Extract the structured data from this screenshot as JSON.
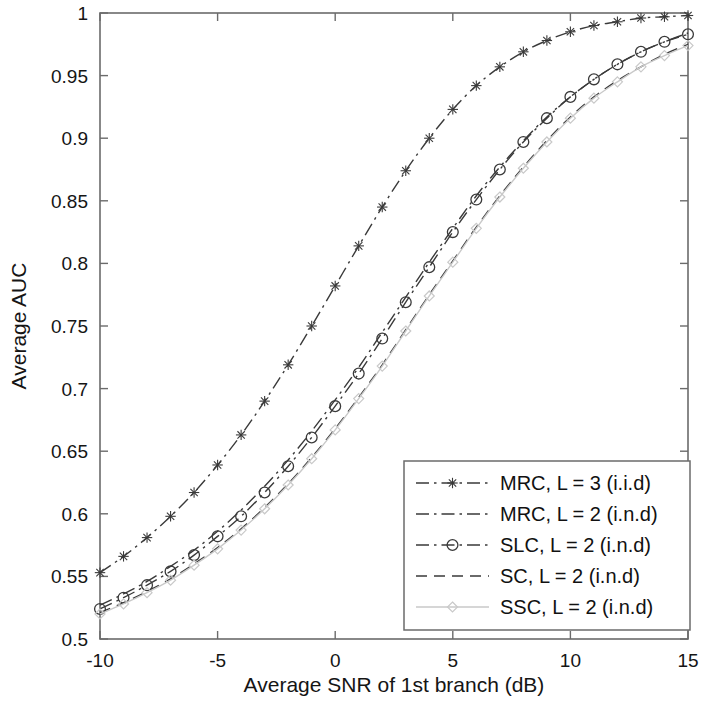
{
  "chart_data": {
    "type": "line",
    "title": "",
    "xlabel": "Average SNR of 1st branch (dB)",
    "ylabel": "Average AUC",
    "xlim": [
      -10,
      15
    ],
    "ylim": [
      0.5,
      1
    ],
    "xticks": [
      -10,
      -5,
      0,
      5,
      10,
      15
    ],
    "xtick_labels": [
      "-10",
      "-5",
      "0",
      "5",
      "10",
      "15"
    ],
    "yticks": [
      0.5,
      0.55,
      0.6,
      0.65,
      0.7,
      0.75,
      0.8,
      0.85,
      0.9,
      0.95,
      1
    ],
    "ytick_labels": [
      "0.5",
      "0.55",
      "0.6",
      "0.65",
      "0.7",
      "0.75",
      "0.8",
      "0.85",
      "0.9",
      "0.95",
      "1"
    ],
    "grid": false,
    "legend_position": "lower right",
    "x": [
      -10,
      -9,
      -8,
      -7,
      -6,
      -5,
      -4,
      -3,
      -2,
      -1,
      0,
      1,
      2,
      3,
      4,
      5,
      6,
      7,
      8,
      9,
      10,
      11,
      12,
      13,
      14,
      15
    ],
    "series": [
      {
        "name": "MRC, L = 3 (i.i.d)",
        "marker": "star",
        "linestyle": "dash-dot",
        "color": "#3a3a3a",
        "values": [
          0.553,
          0.566,
          0.581,
          0.598,
          0.617,
          0.639,
          0.663,
          0.69,
          0.719,
          0.75,
          0.782,
          0.814,
          0.845,
          0.874,
          0.9,
          0.923,
          0.942,
          0.957,
          0.969,
          0.978,
          0.985,
          0.99,
          0.993,
          0.996,
          0.997,
          0.998
        ]
      },
      {
        "name": "MRC, L = 2 (i.n.d)",
        "marker": "none",
        "linestyle": "dash-dot",
        "color": "#3a3a3a",
        "values": [
          0.527,
          0.536,
          0.546,
          0.558,
          0.571,
          0.586,
          0.603,
          0.622,
          0.643,
          0.666,
          0.691,
          0.717,
          0.745,
          0.773,
          0.801,
          0.828,
          0.854,
          0.877,
          0.898,
          0.917,
          0.933,
          0.947,
          0.959,
          0.969,
          0.977,
          0.984
        ]
      },
      {
        "name": "SLC, L = 2 (i.n.d)",
        "marker": "circle",
        "linestyle": "dash-dot",
        "color": "#3a3a3a",
        "values": [
          0.524,
          0.533,
          0.543,
          0.554,
          0.567,
          0.582,
          0.598,
          0.617,
          0.638,
          0.661,
          0.686,
          0.712,
          0.74,
          0.769,
          0.797,
          0.825,
          0.851,
          0.875,
          0.897,
          0.916,
          0.933,
          0.947,
          0.959,
          0.969,
          0.977,
          0.983
        ]
      },
      {
        "name": "SC, L = 2 (i.n.d)",
        "marker": "none",
        "linestyle": "dashed",
        "color": "#3a3a3a",
        "values": [
          0.521,
          0.529,
          0.538,
          0.548,
          0.56,
          0.573,
          0.588,
          0.605,
          0.624,
          0.645,
          0.668,
          0.693,
          0.719,
          0.747,
          0.775,
          0.802,
          0.829,
          0.854,
          0.877,
          0.898,
          0.917,
          0.933,
          0.946,
          0.957,
          0.967,
          0.975
        ]
      },
      {
        "name": "SSC, L = 2 (i.n.d)",
        "marker": "diamond",
        "linestyle": "solid",
        "color": "#c9c9c9",
        "values": [
          0.52,
          0.528,
          0.537,
          0.547,
          0.559,
          0.572,
          0.587,
          0.604,
          0.623,
          0.644,
          0.667,
          0.692,
          0.718,
          0.746,
          0.774,
          0.801,
          0.828,
          0.853,
          0.876,
          0.897,
          0.916,
          0.932,
          0.945,
          0.957,
          0.966,
          0.974
        ]
      }
    ]
  },
  "legend": {
    "items": [
      {
        "label": "MRC, L = 3 (i.i.d)"
      },
      {
        "label": "MRC, L = 2 (i.n.d)"
      },
      {
        "label": "SLC, L = 2 (i.n.d)"
      },
      {
        "label": "SC, L = 2 (i.n.d)"
      },
      {
        "label": "SSC, L = 2 (i.n.d)"
      }
    ]
  },
  "style": {
    "axis_color": "#6b6b6b",
    "text_color": "#151515",
    "background": "#ffffff"
  }
}
